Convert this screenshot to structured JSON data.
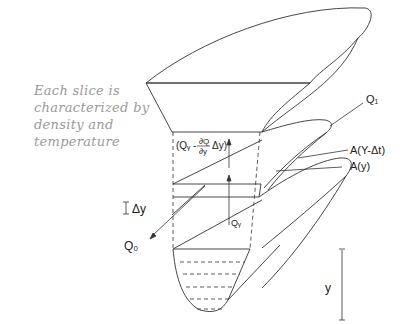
{
  "annotation": {
    "lines": [
      "Each slice is",
      "characterized by",
      "density and",
      "temperature"
    ]
  },
  "labels": {
    "q_in": "Q₁",
    "q_out": "Q₀",
    "q_y": "Qᵧ",
    "flux_top": "(Qᵧ - ∂Q/∂y Δy)",
    "flux_top_prefix": "(Qᵧ -",
    "flux_top_num": "∂Q",
    "flux_top_den": "∂y",
    "flux_top_suffix": "Δy)",
    "area_upper": "A(Y-Δt)",
    "area_lower": "A(y)",
    "delta_y": "Δy",
    "depth_y": "y"
  },
  "colors": {
    "line": "#333333",
    "handwriting": "#9a9a9a",
    "background": "#ffffff"
  }
}
